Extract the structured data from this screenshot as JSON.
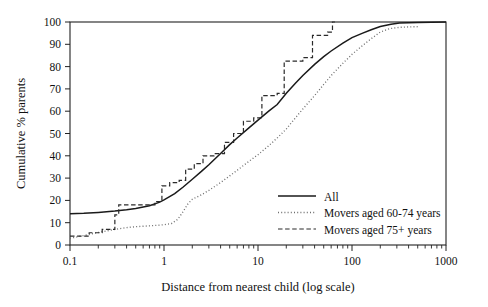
{
  "chart_data": {
    "type": "line",
    "title": "",
    "xlabel": "Distance from nearest child (log scale)",
    "ylabel": "Cumulative % parents",
    "xscale": "log",
    "xlim": [
      0.1,
      1000
    ],
    "ylim": [
      0,
      100
    ],
    "grid": false,
    "legend_position": "lower-right-inside",
    "x_tick_labels": [
      "0.1",
      "1",
      "10",
      "100",
      "1000"
    ],
    "x_tick_values": [
      0.1,
      1,
      10,
      100,
      1000
    ],
    "y_tick_labels": [
      "0",
      "10",
      "20",
      "30",
      "40",
      "50",
      "60",
      "70",
      "80",
      "90",
      "100"
    ],
    "y_tick_values": [
      0,
      10,
      20,
      30,
      40,
      50,
      60,
      70,
      80,
      90,
      100
    ],
    "series": [
      {
        "name": "All",
        "style": "solid",
        "color": "#1a1a1a",
        "points": [
          [
            0.1,
            14.0
          ],
          [
            0.14,
            14.2
          ],
          [
            0.2,
            14.6
          ],
          [
            0.3,
            15.2
          ],
          [
            0.4,
            15.8
          ],
          [
            0.5,
            16.4
          ],
          [
            0.7,
            17.6
          ],
          [
            0.9,
            19.2
          ],
          [
            1.0,
            20.2
          ],
          [
            1.3,
            23.0
          ],
          [
            1.6,
            26.0
          ],
          [
            2.0,
            29.5
          ],
          [
            2.5,
            33.0
          ],
          [
            3.0,
            36.0
          ],
          [
            4.0,
            41.0
          ],
          [
            5.0,
            45.0
          ],
          [
            6.0,
            48.0
          ],
          [
            8.0,
            52.5
          ],
          [
            10.0,
            56.0
          ],
          [
            13.0,
            60.0
          ],
          [
            16.0,
            63.0
          ],
          [
            20.0,
            68.0
          ],
          [
            25.0,
            72.5
          ],
          [
            30.0,
            76.0
          ],
          [
            40.0,
            81.0
          ],
          [
            50.0,
            84.5
          ],
          [
            60.0,
            87.0
          ],
          [
            80.0,
            90.5
          ],
          [
            100.0,
            93.0
          ],
          [
            130.0,
            95.0
          ],
          [
            160.0,
            96.5
          ],
          [
            200.0,
            98.0
          ],
          [
            260.0,
            99.0
          ],
          [
            320.0,
            99.5
          ],
          [
            500.0,
            99.8
          ],
          [
            1000.0,
            100.0
          ]
        ]
      },
      {
        "name": "Movers aged 60-74 years",
        "style": "dotted",
        "color": "#6e6e6e",
        "points": [
          [
            0.1,
            3.0
          ],
          [
            0.15,
            4.5
          ],
          [
            0.2,
            5.6
          ],
          [
            0.3,
            7.0
          ],
          [
            0.4,
            7.8
          ],
          [
            0.5,
            8.2
          ],
          [
            0.7,
            8.6
          ],
          [
            0.9,
            8.9
          ],
          [
            1.0,
            9.1
          ],
          [
            1.2,
            9.6
          ],
          [
            1.4,
            11.5
          ],
          [
            1.6,
            15.0
          ],
          [
            1.8,
            18.5
          ],
          [
            2.0,
            20.5
          ],
          [
            2.5,
            22.5
          ],
          [
            3.0,
            24.5
          ],
          [
            4.0,
            28.0
          ],
          [
            5.0,
            31.0
          ],
          [
            6.0,
            33.5
          ],
          [
            8.0,
            37.5
          ],
          [
            10.0,
            40.5
          ],
          [
            13.0,
            44.5
          ],
          [
            16.0,
            48.0
          ],
          [
            20.0,
            52.0
          ],
          [
            25.0,
            57.0
          ],
          [
            30.0,
            61.0
          ],
          [
            40.0,
            67.0
          ],
          [
            50.0,
            72.0
          ],
          [
            60.0,
            76.0
          ],
          [
            80.0,
            81.5
          ],
          [
            100.0,
            85.5
          ],
          [
            130.0,
            89.5
          ],
          [
            160.0,
            92.5
          ],
          [
            200.0,
            95.5
          ],
          [
            250.0,
            97.0
          ],
          [
            320.0,
            97.6
          ],
          [
            400.0,
            97.8
          ],
          [
            500.0,
            97.9
          ]
        ]
      },
      {
        "name": "Movers aged 75+ years",
        "style": "dashed",
        "color": "#2a2a2a",
        "points": [
          [
            0.1,
            4.0
          ],
          [
            0.16,
            4.0
          ],
          [
            0.16,
            5.5
          ],
          [
            0.22,
            5.5
          ],
          [
            0.22,
            7.0
          ],
          [
            0.3,
            7.0
          ],
          [
            0.3,
            13.5
          ],
          [
            0.33,
            13.5
          ],
          [
            0.33,
            18.0
          ],
          [
            0.8,
            18.0
          ],
          [
            0.8,
            19.5
          ],
          [
            0.95,
            19.5
          ],
          [
            0.95,
            26.5
          ],
          [
            1.15,
            26.5
          ],
          [
            1.15,
            28.0
          ],
          [
            1.45,
            28.0
          ],
          [
            1.45,
            29.0
          ],
          [
            1.7,
            29.0
          ],
          [
            1.7,
            34.0
          ],
          [
            2.1,
            34.0
          ],
          [
            2.1,
            36.5
          ],
          [
            2.6,
            36.5
          ],
          [
            2.6,
            40.0
          ],
          [
            3.4,
            40.0
          ],
          [
            3.4,
            41.0
          ],
          [
            4.4,
            41.0
          ],
          [
            4.4,
            46.0
          ],
          [
            5.5,
            46.0
          ],
          [
            5.5,
            50.0
          ],
          [
            7.0,
            50.0
          ],
          [
            7.0,
            55.5
          ],
          [
            9.0,
            55.5
          ],
          [
            9.0,
            57.0
          ],
          [
            11.0,
            57.0
          ],
          [
            11.0,
            67.0
          ],
          [
            16.0,
            67.0
          ],
          [
            16.0,
            68.0
          ],
          [
            19.0,
            68.0
          ],
          [
            19.0,
            82.5
          ],
          [
            30.0,
            82.5
          ],
          [
            30.0,
            84.0
          ],
          [
            38.0,
            84.0
          ],
          [
            38.0,
            94.0
          ],
          [
            55.0,
            94.0
          ],
          [
            55.0,
            95.5
          ],
          [
            62.0,
            95.5
          ],
          [
            62.0,
            100.0
          ],
          [
            66.0,
            100.0
          ]
        ]
      }
    ]
  },
  "legend": {
    "items": [
      {
        "label": "All",
        "style": "solid"
      },
      {
        "label": "Movers aged 60-74 years",
        "style": "dotted"
      },
      {
        "label": "Movers aged 75+ years",
        "style": "dashed"
      }
    ]
  },
  "axes": {
    "x_title": "Distance from nearest child (log scale)",
    "y_title": "Cumulative % parents"
  }
}
